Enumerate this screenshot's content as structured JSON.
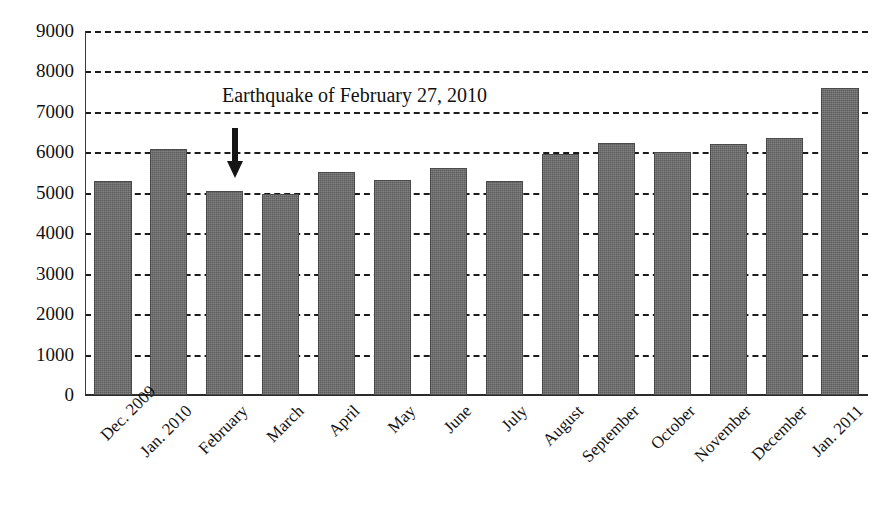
{
  "chart_data": {
    "type": "bar",
    "title": "",
    "xlabel": "",
    "ylabel": "",
    "ylim": [
      0,
      9000
    ],
    "ytick_step": 1000,
    "grid": true,
    "grid_style": "dashed-horizontal",
    "legend": "none",
    "bar_color": "#5d5d5d",
    "categories": [
      "Dec. 2009",
      "Jan. 2010",
      "February",
      "March",
      "April",
      "May",
      "June",
      "July",
      "August",
      "September",
      "October",
      "November",
      "December",
      "Jan. 2011"
    ],
    "values": [
      5300,
      6080,
      5050,
      4980,
      5520,
      5320,
      5620,
      5300,
      5950,
      6230,
      6020,
      6200,
      6350,
      7580
    ],
    "ytick_labels": [
      "9000",
      "8000",
      "7000",
      "6000",
      "5000",
      "4000",
      "3000",
      "2000",
      "1000",
      "0"
    ],
    "ytick_values": [
      9000,
      8000,
      7000,
      6000,
      5000,
      4000,
      3000,
      2000,
      1000,
      0
    ],
    "annotations": [
      {
        "text": "Earthquake of February 27, 2010",
        "points_to_category": "February",
        "marker": "down-arrow"
      }
    ]
  }
}
